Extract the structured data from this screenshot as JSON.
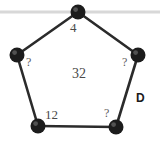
{
  "figure": {
    "background_color": "#ffffff",
    "edge_color": "#2b2b2b",
    "node_color": "#1c1c1c",
    "guideline_color": "#d8d8d8",
    "label_color": "#4a4a4a"
  },
  "guideline": {
    "name": "horizontal-guide-line",
    "y": 12,
    "x1": 0,
    "x2": 160
  },
  "vertices": [
    {
      "id": "top",
      "x": 78,
      "y": 12,
      "r": 7.5,
      "label": "4",
      "label_x": 70,
      "label_y": 21
    },
    {
      "id": "left",
      "x": 17,
      "y": 55,
      "r": 7.5,
      "label": "?",
      "label_x": 26,
      "label_y": 56
    },
    {
      "id": "right",
      "x": 138,
      "y": 55,
      "r": 7.5,
      "label": "?",
      "label_x": 122,
      "label_y": 56
    },
    {
      "id": "bottom-left",
      "x": 38,
      "y": 126,
      "r": 7.5,
      "label": "12",
      "label_x": 45,
      "label_y": 108
    },
    {
      "id": "bottom-right",
      "x": 116,
      "y": 127,
      "r": 7.5,
      "label": "?",
      "label_x": 104,
      "label_y": 107
    }
  ],
  "edges": [
    {
      "id": "top-left-edge",
      "from": "top",
      "to": "left"
    },
    {
      "id": "top-right-edge",
      "from": "top",
      "to": "right"
    },
    {
      "id": "left-lower-edge",
      "from": "left",
      "to": "bottom-left"
    },
    {
      "id": "bottom-edge",
      "from": "bottom-left",
      "to": "bottom-right"
    },
    {
      "id": "right-lower-edge",
      "from": "bottom-right",
      "to": "right"
    }
  ],
  "labels": {
    "vertex_top": "4",
    "vertex_left": "?",
    "vertex_right": "?",
    "vertex_bottom_left": "12",
    "vertex_bottom_right": "?",
    "interior": "32",
    "region": "D"
  }
}
